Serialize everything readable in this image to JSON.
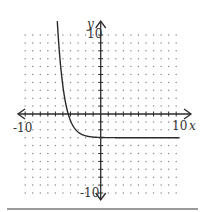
{
  "chart_data": {
    "type": "line",
    "title": "",
    "xlabel": "x",
    "ylabel": "y",
    "xlim": [
      -10,
      10
    ],
    "ylim": [
      -10,
      10
    ],
    "grid": "dots",
    "tick_labels": {
      "x_min": "-10",
      "x_max": "10",
      "y_min": "-10",
      "y_max": "10"
    },
    "series": [
      {
        "name": "exponential decay curve",
        "description": "decreasing exponential with horizontal asymptote y = -3, x-intercept near x = -4.3",
        "asymptote_y": -3,
        "x": [
          -5.6,
          -5.3,
          -5.0,
          -4.6,
          -4.3,
          -4.0,
          -3.5,
          -3.0,
          -2.5,
          -2.0,
          -1.0,
          0,
          2,
          4,
          6,
          8,
          10.5
        ],
        "y": [
          9.5,
          7.2,
          5.3,
          3.0,
          0.0,
          -1.0,
          -2.0,
          -2.5,
          -2.75,
          -2.9,
          -2.98,
          -3.0,
          -3.0,
          -3.0,
          -3.0,
          -3.0,
          -3.0
        ]
      }
    ]
  },
  "labels": {
    "x_axis": "x",
    "y_axis": "y",
    "x_min": "-10",
    "x_max": "10",
    "y_max": "10",
    "y_min": "-10"
  },
  "colors": {
    "axis": "#2a2a2a",
    "curve": "#2a2a2a",
    "dots": "#8a8a8a"
  }
}
